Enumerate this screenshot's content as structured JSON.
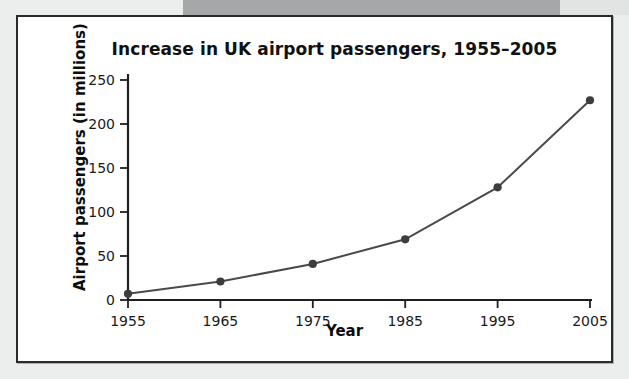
{
  "figure": {
    "title": "Increase in UK airport passengers, 1955–2005",
    "xlabel": "Year",
    "ylabel": "Airport passengers (in millions)",
    "panel_background": "#ffffff",
    "page_background": "#eceded",
    "border_color": "#2b2b2b",
    "line_color": "#4a4a4a",
    "marker_color": "#3d3d3d",
    "axis_color": "#1f1f1f"
  },
  "chart_data": {
    "type": "line",
    "title": "Increase in UK airport passengers, 1955–2005",
    "xlabel": "Year",
    "ylabel": "Airport passengers (in millions)",
    "x": [
      1955,
      1965,
      1975,
      1985,
      1995,
      2005
    ],
    "xticklabels": [
      "1955",
      "1965",
      "1975",
      "1985",
      "1995",
      "2005"
    ],
    "values": [
      7,
      21,
      41,
      69,
      128,
      227
    ],
    "yticks": [
      0,
      50,
      100,
      150,
      200,
      250
    ],
    "yticklabels": [
      "0",
      "50",
      "100",
      "150",
      "200",
      "250"
    ],
    "xlim": [
      1955,
      2005
    ],
    "ylim": [
      0,
      250
    ],
    "grid": false,
    "legend": null,
    "markers": "circle",
    "series": [
      {
        "name": "UK airport passengers",
        "values": [
          7,
          21,
          41,
          69,
          128,
          227
        ]
      }
    ]
  }
}
